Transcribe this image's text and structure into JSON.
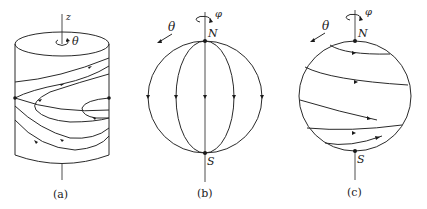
{
  "figure": {
    "panels": [
      {
        "id": "a",
        "caption": "(a)",
        "shape": "cylinder",
        "axis_label": "z",
        "rotation_label": "θ",
        "description": "Flow lines on a cylinder wrapping around with fixed points on left and right edges"
      },
      {
        "id": "b",
        "caption": "(b)",
        "shape": "sphere",
        "pole_top": "N",
        "pole_bottom": "S",
        "axis_rotation_label": "φ",
        "direction_label": "θ",
        "description": "Meridian flow lines from N to S with arrows at the equator"
      },
      {
        "id": "c",
        "caption": "(c)",
        "shape": "sphere",
        "pole_top": "N",
        "pole_bottom": "S",
        "axis_rotation_label": "φ",
        "direction_label": "θ",
        "description": "Spiral flow lines on a sphere from N to S"
      }
    ]
  },
  "labels": {
    "a_caption": "(a)",
    "b_caption": "(b)",
    "c_caption": "(c)",
    "z": "z",
    "theta": "θ",
    "phi": "φ",
    "N": "N",
    "S": "S"
  }
}
